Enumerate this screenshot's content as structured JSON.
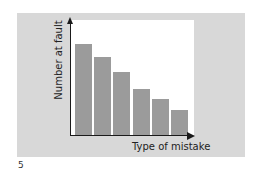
{
  "chart_data": {
    "type": "bar",
    "title": "",
    "xlabel": "Type of mistake",
    "ylabel": "Number at fault",
    "categories": [
      "1",
      "2",
      "3",
      "4",
      "5",
      "6"
    ],
    "values": [
      91,
      78,
      63,
      46,
      36,
      25
    ],
    "value_units": "relative (no numeric axis shown)",
    "ylim": [
      0,
      100
    ],
    "grid": false,
    "legend": null,
    "sorted": "descending (Pareto-style)",
    "colors": {
      "bars": "#9b9b9b",
      "panel": "#d8d8d8",
      "plot": "#ffffff",
      "axes": "#1a1a1a"
    }
  },
  "figure": {
    "page_number": "5"
  }
}
